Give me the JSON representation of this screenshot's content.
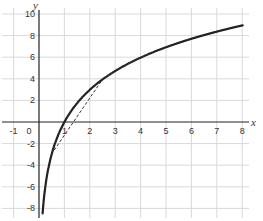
{
  "chart_data": {
    "type": "line",
    "title": "",
    "xlabel": "x",
    "ylabel": "y",
    "xlim": [
      -1.5,
      8.4
    ],
    "ylim": [
      -8.6,
      10.7
    ],
    "grid": true,
    "x_ticks": [
      -1,
      0,
      1,
      2,
      3,
      4,
      5,
      6,
      7,
      8
    ],
    "y_ticks": [
      -8,
      -6,
      -4,
      -2,
      2,
      4,
      6,
      8,
      10
    ],
    "x_tick_labels": [
      "-1",
      "0",
      "1",
      "2",
      "3",
      "4",
      "5",
      "6",
      "7",
      "8"
    ],
    "y_tick_labels": [
      "-8",
      "-6",
      "-4",
      "-2",
      "2",
      "4",
      "6",
      "8",
      "10"
    ],
    "series": [
      {
        "name": "curve",
        "style": "solid",
        "description": "logarithmic curve approx y = 4.3 ln(x)",
        "x": [
          0.14,
          0.2,
          0.3,
          0.5,
          0.75,
          1,
          1.5,
          2,
          2.5,
          3,
          4,
          5,
          6,
          7,
          8
        ],
        "y": [
          -8.45,
          -6.92,
          -5.18,
          -2.98,
          -1.24,
          0,
          1.74,
          2.98,
          3.94,
          4.72,
          5.96,
          6.92,
          7.7,
          8.37,
          8.94
        ]
      },
      {
        "name": "secant",
        "style": "dashed",
        "description": "dashed secant line between two points on the curve",
        "x": [
          0.6,
          2.5
        ],
        "y": [
          -2.6,
          3.94
        ]
      },
      {
        "name": "dotted-overlay",
        "style": "dotted",
        "description": "dotted segment overlapping the curve",
        "x": [
          2.5,
          3,
          3.5,
          4,
          4.4
        ],
        "y": [
          3.94,
          4.72,
          5.39,
          5.96,
          6.37
        ]
      }
    ],
    "legend": null
  },
  "labels": {
    "x_axis": "x",
    "y_axis": "y"
  },
  "colors": {
    "curve": "#222222",
    "grid": "#d9d9d9",
    "axis": "#222222",
    "text": "#333333"
  }
}
